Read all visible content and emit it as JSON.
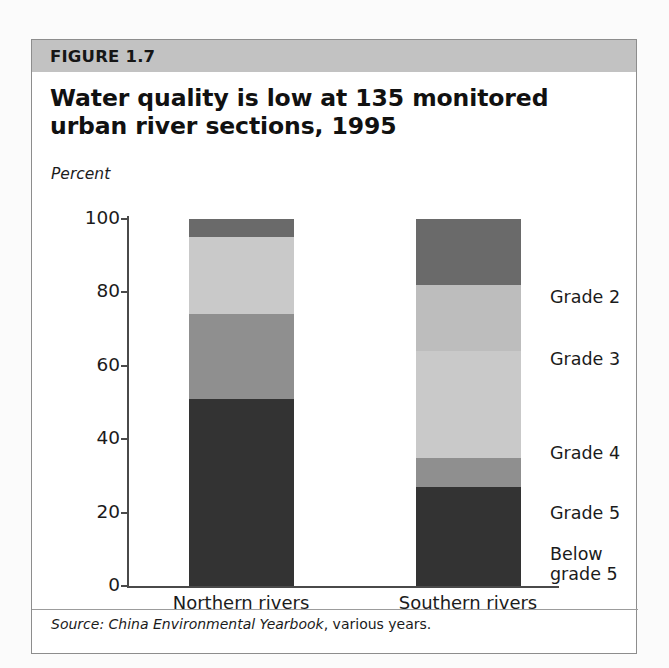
{
  "figure": {
    "number_label": "FIGURE 1.7",
    "title": "Water quality is low at 135 monitored urban river sections, 1995",
    "axis_unit": "Percent",
    "source_lead": "Source:",
    "source_title": "China Environmental Yearbook",
    "source_tail": ", various years."
  },
  "colors": {
    "header_band": "#c2c2c2",
    "frame": "#8d8d8d",
    "axis": "#4a4a4a",
    "grade2": "#6a6a6a",
    "grade3": "#bdbdbd",
    "grade4": "#c9c9c9",
    "grade5": "#8f8f8f",
    "below5": "#333333",
    "text": "#1b1b1b"
  },
  "legend": {
    "items": [
      {
        "label": "Grade 2",
        "key": "grade2",
        "top": 248
      },
      {
        "label": "Grade 3",
        "key": "grade3",
        "top": 310
      },
      {
        "label": "Grade 4",
        "key": "grade4",
        "top": 404
      },
      {
        "label": "Grade 5",
        "key": "grade5",
        "top": 464
      },
      {
        "label": "Below grade 5",
        "key": "below5",
        "top": 505
      }
    ]
  },
  "chart_data": {
    "type": "bar",
    "stacked": true,
    "title": "Water quality is low at 135 monitored urban river sections, 1995",
    "xlabel": "",
    "ylabel": "Percent",
    "ylim": [
      0,
      100
    ],
    "yticks": [
      0,
      20,
      40,
      60,
      80,
      100
    ],
    "grid": false,
    "legend_position": "right",
    "categories": [
      "Northern rivers",
      "Southern rivers"
    ],
    "series": [
      {
        "name": "Below grade 5",
        "values": [
          51,
          27
        ],
        "color": "#333333"
      },
      {
        "name": "Grade 5",
        "values": [
          23,
          8
        ],
        "color": "#8f8f8f"
      },
      {
        "name": "Grade 4",
        "values": [
          21,
          29
        ],
        "color": "#c9c9c9"
      },
      {
        "name": "Grade 3",
        "values": [
          0,
          18
        ],
        "color": "#bdbdbd"
      },
      {
        "name": "Grade 2",
        "values": [
          5,
          18
        ],
        "color": "#6a6a6a"
      }
    ],
    "source": "Source: China Environmental Yearbook, various years."
  }
}
